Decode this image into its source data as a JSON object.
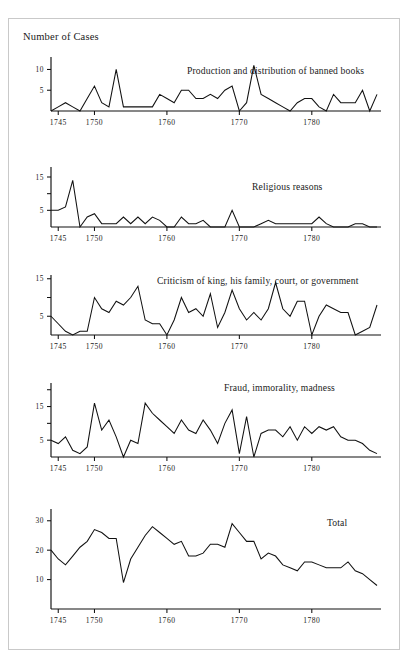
{
  "figure": {
    "axis_title": "Number of Cases",
    "top_bleed_text": "",
    "xlabel": "",
    "x_tick_labels": [
      "1745",
      "1750",
      "1760",
      "1770",
      "1780"
    ],
    "x_tick_years": [
      1745,
      1750,
      1760,
      1770,
      1780
    ],
    "x_range": [
      1744,
      1789
    ],
    "line_color": "#111111",
    "frame_color": "#c9c9c9",
    "background": "#ffffff"
  },
  "chart_data": [
    {
      "type": "line",
      "title": "Production and distribution of banned books",
      "xlabel": "",
      "ylabel": "Number of Cases",
      "ylim": [
        0,
        13
      ],
      "y_ticks": [
        5,
        10
      ],
      "y_tick_labels": [
        "5",
        "10"
      ],
      "grid": false,
      "legend": "none",
      "x": [
        1744,
        1745,
        1746,
        1747,
        1748,
        1749,
        1750,
        1751,
        1752,
        1753,
        1754,
        1755,
        1756,
        1757,
        1758,
        1759,
        1760,
        1761,
        1762,
        1763,
        1764,
        1765,
        1766,
        1767,
        1768,
        1769,
        1770,
        1771,
        1772,
        1773,
        1774,
        1775,
        1776,
        1777,
        1778,
        1779,
        1780,
        1781,
        1782,
        1783,
        1784,
        1785,
        1786,
        1787,
        1788,
        1789
      ],
      "values": [
        0,
        1,
        2,
        1,
        0,
        3,
        6,
        2,
        1,
        10,
        1,
        1,
        1,
        1,
        1,
        4,
        3,
        2,
        5,
        5,
        3,
        3,
        4,
        3,
        5,
        6,
        0,
        2,
        11,
        4,
        3,
        2,
        1,
        0,
        2,
        3,
        3,
        1,
        0,
        4,
        2,
        2,
        2,
        5,
        0,
        4
      ]
    },
    {
      "type": "line",
      "title": "Religious reasons",
      "xlabel": "",
      "ylabel": "",
      "ylim": [
        0,
        18
      ],
      "y_ticks": [
        5,
        10,
        15
      ],
      "y_tick_labels": [
        "5",
        "",
        "15"
      ],
      "grid": false,
      "legend": "none",
      "x": [
        1744,
        1745,
        1746,
        1747,
        1748,
        1749,
        1750,
        1751,
        1752,
        1753,
        1754,
        1755,
        1756,
        1757,
        1758,
        1759,
        1760,
        1761,
        1762,
        1763,
        1764,
        1765,
        1766,
        1767,
        1768,
        1769,
        1770,
        1771,
        1772,
        1773,
        1774,
        1775,
        1776,
        1777,
        1778,
        1779,
        1780,
        1781,
        1782,
        1783,
        1784,
        1785,
        1786,
        1787,
        1788,
        1789
      ],
      "values": [
        5,
        5,
        6,
        14,
        0,
        3,
        4,
        1,
        1,
        1,
        3,
        1,
        3,
        1,
        3,
        2,
        0,
        0,
        3,
        1,
        1,
        2,
        0,
        0,
        0,
        5,
        0,
        0,
        0,
        1,
        2,
        1,
        1,
        1,
        1,
        1,
        1,
        3,
        1,
        0,
        0,
        0,
        1,
        1,
        0,
        0
      ]
    },
    {
      "type": "line",
      "title": "Criticism of king, his family, court, or government",
      "xlabel": "",
      "ylabel": "",
      "ylim": [
        0,
        16
      ],
      "y_ticks": [
        5,
        10,
        15
      ],
      "y_tick_labels": [
        "5",
        "",
        "15"
      ],
      "grid": false,
      "legend": "none",
      "x": [
        1744,
        1745,
        1746,
        1747,
        1748,
        1749,
        1750,
        1751,
        1752,
        1753,
        1754,
        1755,
        1756,
        1757,
        1758,
        1759,
        1760,
        1761,
        1762,
        1763,
        1764,
        1765,
        1766,
        1767,
        1768,
        1769,
        1770,
        1771,
        1772,
        1773,
        1774,
        1775,
        1776,
        1777,
        1778,
        1779,
        1780,
        1781,
        1782,
        1783,
        1784,
        1785,
        1786,
        1787,
        1788,
        1789
      ],
      "values": [
        5,
        3,
        1,
        0,
        1,
        1,
        10,
        7,
        6,
        9,
        8,
        10,
        13,
        4,
        3,
        3,
        0,
        4,
        10,
        6,
        7,
        5,
        11,
        2,
        6,
        12,
        7,
        4,
        6,
        4,
        7,
        14,
        7,
        5,
        9,
        9,
        0,
        5,
        8,
        7,
        6,
        6,
        0,
        1,
        2,
        8
      ]
    },
    {
      "type": "line",
      "title": "Fraud, immorality, madness",
      "xlabel": "",
      "ylabel": "",
      "ylim": [
        0,
        22
      ],
      "y_ticks": [
        5,
        10,
        15,
        20
      ],
      "y_tick_labels": [
        "5",
        "",
        "15",
        ""
      ],
      "grid": false,
      "legend": "none",
      "x": [
        1744,
        1745,
        1746,
        1747,
        1748,
        1749,
        1750,
        1751,
        1752,
        1753,
        1754,
        1755,
        1756,
        1757,
        1758,
        1759,
        1760,
        1761,
        1762,
        1763,
        1764,
        1765,
        1766,
        1767,
        1768,
        1769,
        1770,
        1771,
        1772,
        1773,
        1774,
        1775,
        1776,
        1777,
        1778,
        1779,
        1780,
        1781,
        1782,
        1783,
        1784,
        1785,
        1786,
        1787,
        1788,
        1789
      ],
      "values": [
        5,
        4,
        6,
        2,
        1,
        3,
        16,
        8,
        11,
        6,
        0,
        5,
        4,
        16,
        13,
        11,
        9,
        7,
        11,
        8,
        7,
        11,
        8,
        4,
        10,
        14,
        1,
        12,
        0,
        7,
        8,
        8,
        6,
        9,
        5,
        9,
        7,
        9,
        8,
        9,
        6,
        5,
        5,
        4,
        2,
        1
      ]
    },
    {
      "type": "line",
      "title": "Total",
      "xlabel": "",
      "ylabel": "",
      "ylim": [
        0,
        34
      ],
      "y_ticks": [
        10,
        20,
        30
      ],
      "y_tick_labels": [
        "10",
        "20",
        "30"
      ],
      "grid": false,
      "legend": "none",
      "x": [
        1744,
        1745,
        1746,
        1747,
        1748,
        1749,
        1750,
        1751,
        1752,
        1753,
        1754,
        1755,
        1756,
        1757,
        1758,
        1759,
        1760,
        1761,
        1762,
        1763,
        1764,
        1765,
        1766,
        1767,
        1768,
        1769,
        1770,
        1771,
        1772,
        1773,
        1774,
        1775,
        1776,
        1777,
        1778,
        1779,
        1780,
        1781,
        1782,
        1783,
        1784,
        1785,
        1786,
        1787,
        1788,
        1789
      ],
      "values": [
        20,
        17,
        15,
        18,
        21,
        23,
        27,
        26,
        24,
        24,
        9,
        17,
        21,
        25,
        28,
        26,
        24,
        22,
        23,
        18,
        18,
        19,
        22,
        22,
        21,
        29,
        26,
        23,
        23,
        17,
        19,
        18,
        15,
        14,
        13,
        16,
        16,
        15,
        14,
        14,
        14,
        16,
        13,
        12,
        10,
        8
      ]
    }
  ]
}
